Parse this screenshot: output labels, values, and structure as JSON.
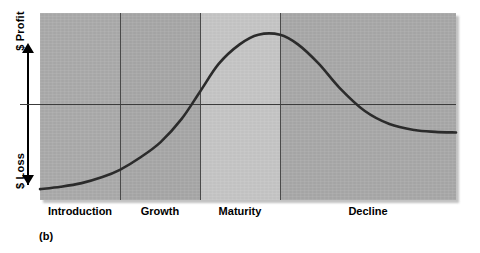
{
  "figure": {
    "caption": "(b)",
    "y_axis": {
      "top_label": "$ Profit",
      "bottom_label": "$ Loss",
      "arrow_up_icon": "arrow-up-icon",
      "arrow_down_icon": "arrow-down-icon"
    }
  },
  "chart_data": {
    "type": "line",
    "title": "",
    "subtitle": "",
    "xlabel": "",
    "ylabel": "$ Profit / $ Loss",
    "caption": "(b)",
    "grid": false,
    "legend": "none",
    "axis_labels": [
      "$ Profit",
      "$ Loss"
    ],
    "zero_line": 0,
    "xlim": [
      0,
      100
    ],
    "ylim": [
      -55,
      100
    ],
    "categories": [
      "Introduction",
      "Growth",
      "Maturity",
      "Decline"
    ],
    "stage_boundaries": [
      0,
      19.2,
      38.5,
      57.7,
      100
    ],
    "stage_colors": [
      "#a9a9a9",
      "#a6a6a6",
      "#c4c4c4",
      "#a7a7a7"
    ],
    "series": [
      {
        "name": "Profit",
        "color": "#2b2b2b",
        "x": [
          0,
          5,
          10,
          15,
          19.2,
          24,
          29,
          34,
          38.5,
          43,
          48,
          52.5,
          57.7,
          62,
          67,
          72,
          78,
          84,
          90,
          95,
          100
        ],
        "y": [
          -46,
          -44,
          -41,
          -36,
          -30,
          -20,
          -7,
          12,
          35,
          58,
          74,
          82,
          82,
          74,
          58,
          38,
          19,
          8,
          3,
          1.5,
          1
        ]
      }
    ],
    "annotations": [
      {
        "text": "Introduction",
        "x": 9.6,
        "position": "below-axis"
      },
      {
        "text": "Growth",
        "x": 28.8,
        "position": "below-axis"
      },
      {
        "text": "Maturity",
        "x": 48.1,
        "position": "below-axis"
      },
      {
        "text": "Decline",
        "x": 78.8,
        "position": "below-axis"
      }
    ]
  }
}
